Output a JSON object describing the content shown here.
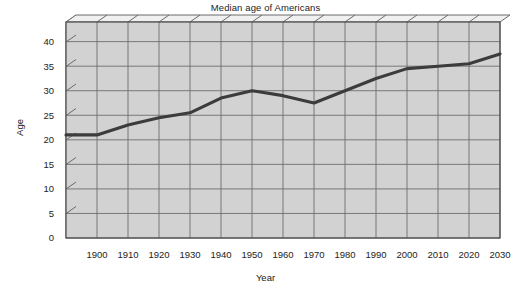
{
  "chart_data": {
    "type": "line",
    "title": "Median age of Americans",
    "xlabel": "Year",
    "ylabel": "Age",
    "x": [
      1890,
      1900,
      1910,
      1920,
      1930,
      1940,
      1950,
      1960,
      1970,
      1980,
      1990,
      2000,
      2010,
      2020,
      2030
    ],
    "values": [
      21.0,
      21.0,
      23.0,
      24.5,
      25.5,
      28.5,
      30.0,
      29.0,
      27.5,
      30.0,
      32.5,
      34.5,
      35.0,
      35.5,
      37.5
    ],
    "series": [
      {
        "name": "Median age",
        "values": [
          21.0,
          21.0,
          23.0,
          24.5,
          25.5,
          28.5,
          30.0,
          29.0,
          27.5,
          30.0,
          32.5,
          34.5,
          35.0,
          35.5,
          37.5
        ]
      }
    ],
    "xlim": [
      1890,
      2030
    ],
    "ylim": [
      0,
      44
    ],
    "x_tick_labels": [
      "1900",
      "1910",
      "1920",
      "1930",
      "1940",
      "1950",
      "1960",
      "1970",
      "1980",
      "1990",
      "2000",
      "2010",
      "2020",
      "2030"
    ],
    "x_tick_values": [
      1900,
      1910,
      1920,
      1930,
      1940,
      1950,
      1960,
      1970,
      1980,
      1990,
      2000,
      2010,
      2020,
      2030
    ],
    "y_tick_labels": [
      "0",
      "5",
      "10",
      "15",
      "20",
      "25",
      "30",
      "35",
      "40"
    ],
    "y_tick_values": [
      0,
      5,
      10,
      15,
      20,
      25,
      30,
      35,
      40
    ],
    "grid": true,
    "legend": "none",
    "colors": {
      "plot_background": "#d2d2d2",
      "grid_line": "#6e6e6e",
      "data_line": "#3c3c3c",
      "axis_line": "#4a4a4a",
      "wall_side": "#e2e2e2",
      "page_background": "#ffffff",
      "text": "#232323"
    }
  }
}
